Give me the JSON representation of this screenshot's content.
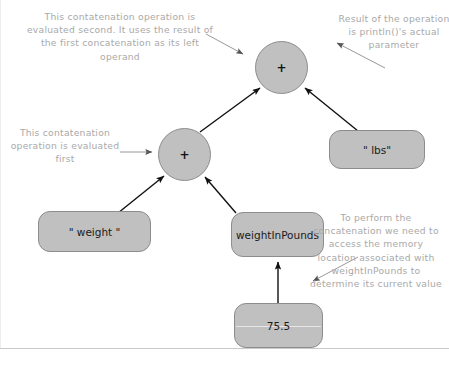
{
  "diagram": {
    "annotations": [
      {
        "id": "top-left",
        "text": "This contatenation operation is evaluated second. It uses the result of the first concatenation as its left operand"
      },
      {
        "id": "top-right",
        "text": "Result of the operation is println()'s actual parameter"
      },
      {
        "id": "mid-left",
        "text": "This contatenation operation is evaluated first"
      },
      {
        "id": "bottom-right",
        "text": "To perform the concatenation we need to access the memory location associated with weightInPounds to determine its current value"
      }
    ],
    "nodes": {
      "plus_top": {
        "label": "+",
        "shape": "circle"
      },
      "plus_mid": {
        "label": "+",
        "shape": "circle"
      },
      "weight_literal": {
        "label": "\" weight \"",
        "shape": "rounded-rect"
      },
      "lbs_literal": {
        "label": "\" lbs\"",
        "shape": "rounded-rect"
      },
      "variable": {
        "label": "weightInPounds",
        "shape": "rounded-rect"
      },
      "memory_value": {
        "label": "75.5",
        "shape": "memory-cell"
      }
    },
    "colors": {
      "node_fill": "#c0c0c0",
      "node_stroke": "#8d8d8d",
      "edge": "#111111",
      "annotation_text": "#a9a9a9",
      "background": "#ffffff"
    }
  }
}
